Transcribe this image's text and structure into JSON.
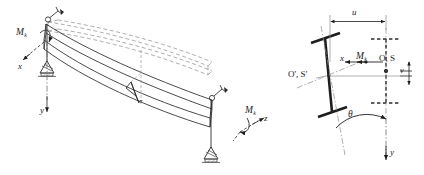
{
  "figure": {
    "type": "engineering-diagram",
    "stroke_color": "#1d1d1d",
    "dashed_color": "#8d8d8d",
    "hatch_color": "#6b6b6b"
  },
  "left_panel": {
    "name": "deformed-beam-3d-view",
    "moment_left": {
      "symbol": "M",
      "subscript": "k"
    },
    "moment_right": {
      "symbol": "M",
      "subscript": "k"
    },
    "axes": [
      {
        "name": "x",
        "label": "x"
      },
      {
        "name": "y",
        "label": "y"
      },
      {
        "name": "z",
        "label": "z"
      }
    ],
    "supports": [
      {
        "name": "support-left",
        "kind": "pinned-fork-support"
      },
      {
        "name": "support-right",
        "kind": "pinned-fork-support"
      }
    ],
    "elements": [
      {
        "name": "undeformed-beam",
        "style": "dashed"
      },
      {
        "name": "deformed-beam",
        "style": "solid"
      },
      {
        "name": "midspan-section",
        "style": "solid"
      },
      {
        "name": "end-rotation-marker-left",
        "style": "solid"
      },
      {
        "name": "end-rotation-marker-right",
        "style": "solid"
      }
    ]
  },
  "right_panel": {
    "name": "cross-section-displacement-view",
    "original_section": {
      "name": "original-i-section",
      "style": "dashed",
      "label": "O, S",
      "label_meaning": "centroid and shear centre, undeformed"
    },
    "displaced_section": {
      "name": "displaced-i-section",
      "style": "solid",
      "label": "O', S'",
      "label_meaning": "centroid and shear centre, displaced"
    },
    "dimensions": [
      {
        "name": "horizontal-displacement",
        "label": "u"
      },
      {
        "name": "vertical-displacement",
        "label": "v"
      }
    ],
    "rotation": {
      "name": "twist-angle",
      "label": "θ"
    },
    "moment": {
      "symbol": "M",
      "subscript": "k"
    },
    "axes": [
      {
        "name": "x",
        "label": "x"
      },
      {
        "name": "y",
        "label": "y"
      }
    ]
  }
}
